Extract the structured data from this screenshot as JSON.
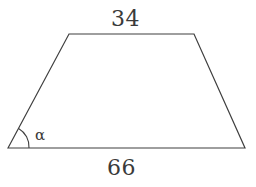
{
  "figure": {
    "kind": "trapezoid-diagram",
    "background_color": "#ffffff",
    "stroke_color": "#3f3f3f",
    "stroke_width": 1.2,
    "vertices": {
      "bottom_left": [
        8,
        148
      ],
      "top_left": [
        69,
        34
      ],
      "top_right": [
        194,
        34
      ],
      "bottom_right": [
        245,
        148
      ]
    },
    "angle_arc": {
      "center": [
        8,
        148
      ],
      "radius": 21,
      "start_point": [
        29,
        148
      ],
      "end_point": [
        18.6,
        128.4
      ]
    }
  },
  "labels": {
    "top_side_length": "34",
    "bottom_side_length": "66",
    "angle_symbol": "α"
  }
}
